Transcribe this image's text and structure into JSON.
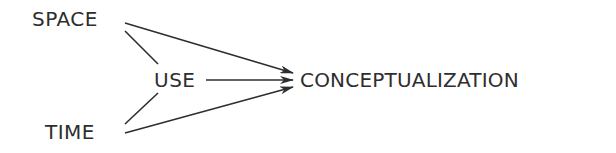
{
  "diagram": {
    "type": "flow",
    "nodes": {
      "space": {
        "label": "SPACE"
      },
      "use": {
        "label": "USE"
      },
      "time": {
        "label": "TIME"
      },
      "conceptualization": {
        "label": "CONCEPTUALIZATION"
      }
    },
    "edges": [
      {
        "from": "SPACE",
        "to": "CONCEPTUALIZATION",
        "style": "arrow"
      },
      {
        "from": "SPACE",
        "to": "USE",
        "style": "line"
      },
      {
        "from": "USE",
        "to": "CONCEPTUALIZATION",
        "style": "arrow"
      },
      {
        "from": "TIME",
        "to": "USE",
        "style": "line"
      },
      {
        "from": "TIME",
        "to": "CONCEPTUALIZATION",
        "style": "arrow"
      }
    ],
    "colors": {
      "ink": "#2e2e2e",
      "background": "#ffffff"
    }
  }
}
